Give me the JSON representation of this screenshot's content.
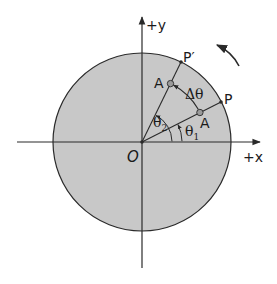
{
  "diagram": {
    "colors": {
      "disk_fill": "#c8c8c8",
      "stroke": "#2a2a2a",
      "background": "#ffffff"
    },
    "axes": {
      "x_label": "+x",
      "y_label": "+y",
      "origin_label": "O"
    },
    "points": {
      "p_label": "P",
      "p_prime_label": "P′",
      "a_initial_label": "A",
      "a_final_label": "A"
    },
    "angles": {
      "theta1_symbol": "θ",
      "theta1_sub": "1",
      "theta2_symbol": "θ",
      "theta2_sub": "2",
      "delta_theta": "Δθ",
      "theta1_deg": 27,
      "theta2_deg": 64
    },
    "rotation_direction": "counterclockwise"
  }
}
